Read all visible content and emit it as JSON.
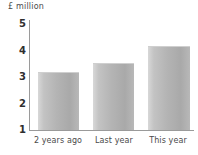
{
  "chart_data": {
    "type": "bar",
    "title": "",
    "subtitle": "",
    "xlabel": "",
    "ylabel": "£ million",
    "categories": [
      "2 years ago",
      "Last year",
      "This year"
    ],
    "values": [
      3.15,
      3.5,
      4.15
    ],
    "series": [
      {
        "name": "£ million",
        "values": [
          3.15,
          3.5,
          4.15
        ]
      }
    ],
    "ytick_labels": [
      "5",
      "4",
      "3",
      "2",
      "1"
    ],
    "ytick_values": [
      5,
      4,
      3,
      2,
      1
    ],
    "ylim": [
      1,
      5
    ],
    "grid": false,
    "legend": false,
    "legend_position": "none",
    "bar_color": "#b4b4b4",
    "axis_color": "#9a9a9a",
    "text_color": "#3a3a3a",
    "background_color": "#ffffff",
    "annotations": []
  },
  "axis": {
    "y_title": "£ million"
  }
}
